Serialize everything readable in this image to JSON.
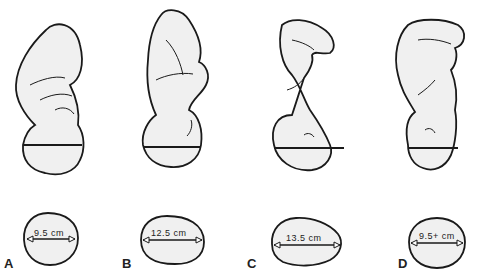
{
  "figure": {
    "panels": [
      {
        "letter": "A",
        "diameter": "9.5 cm"
      },
      {
        "letter": "B",
        "diameter": "12.5 cm"
      },
      {
        "letter": "C",
        "diameter": "13.5 cm"
      },
      {
        "letter": "D",
        "diameter": "9.5+ cm"
      }
    ]
  },
  "colors": {
    "stroke": "#1a1a1a",
    "fill": "#f0f0f0",
    "background": "#ffffff"
  }
}
